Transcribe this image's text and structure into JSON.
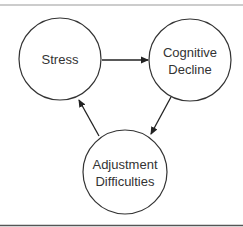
{
  "diagram": {
    "type": "cycle",
    "nodes": [
      {
        "id": "stress",
        "lines": [
          "Stress"
        ],
        "cx": 60,
        "cy": 59,
        "r": 41
      },
      {
        "id": "cognitive-decline",
        "lines": [
          "Cognitive",
          "Decline"
        ],
        "cx": 190,
        "cy": 60,
        "r": 41
      },
      {
        "id": "adjustment-difficulties",
        "lines": [
          "Adjustment",
          "Difficulties"
        ],
        "cx": 125,
        "cy": 172,
        "r": 42
      }
    ],
    "edges": [
      {
        "from": "stress",
        "to": "cognitive-decline"
      },
      {
        "from": "cognitive-decline",
        "to": "adjustment-difficulties"
      },
      {
        "from": "adjustment-difficulties",
        "to": "stress"
      }
    ],
    "colors": {
      "stroke": "#333333",
      "text": "#333333",
      "top_rule": "#9a9a9a",
      "bottom_rule": "#555555",
      "background": "#ffffff"
    }
  }
}
